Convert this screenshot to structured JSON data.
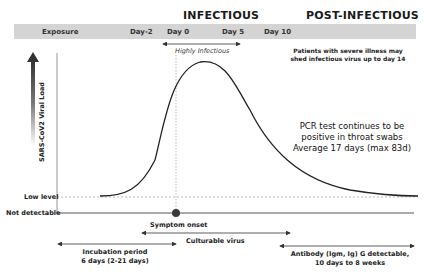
{
  "header": {
    "infectious_label": "INFECTIOUS",
    "post_infectious_label": "POST-INFECTIOUS"
  },
  "timeline": {
    "labels": [
      "Exposure",
      "Day-2",
      "Day 0",
      "Day 5",
      "Day 10"
    ],
    "band_color": "#d4d4d4"
  },
  "annotations": {
    "highly_infectious": "Highly Infectious",
    "severe_illness_line1": "Patients with severe illness may",
    "severe_illness_line2": "shed infectious virus up to day 14",
    "pcr_line1": "PCR test continues to be",
    "pcr_line2": "positive in throat swabs",
    "pcr_line3": "Average 17 days (max 83d)",
    "symptom_onset": "Symptom onset",
    "culturable_virus": "Culturable virus",
    "incubation_line1": "Incubation period",
    "incubation_line2": "6 days (2-21 days)",
    "antibody_line1": "Antibody (Igm, Ig) G detectable,",
    "antibody_line2": "10 days to 8 weeks"
  },
  "axis": {
    "y_label": "SARS-CoV2 Viral Load",
    "low_level": "Low level",
    "not_detectable": "Not detectable"
  },
  "colors": {
    "curve": "#222222",
    "onset_dot": "#3a3a3a",
    "dashed": "#aaaaaa"
  }
}
